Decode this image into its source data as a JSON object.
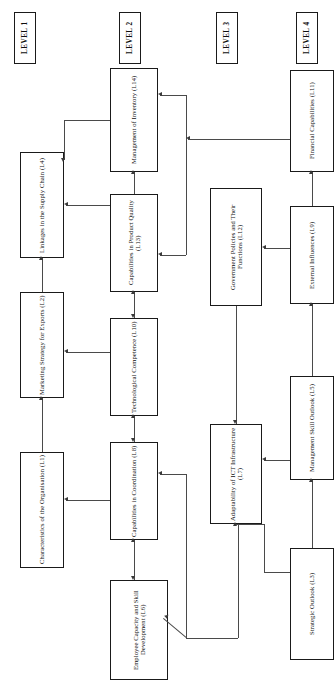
{
  "diagram": {
    "orientation": "rotated-90-ccw",
    "levels": [
      {
        "id": "lvl1",
        "label": "LEVEL 1"
      },
      {
        "id": "lvl2",
        "label": "LEVEL 2"
      },
      {
        "id": "lvl3",
        "label": "LEVEL 3"
      },
      {
        "id": "lvl4",
        "label": "LEVEL 4"
      }
    ],
    "nodes": [
      {
        "id": "L4",
        "label": "Linkages in the Supply Chain (L4)",
        "level": "LEVEL 1"
      },
      {
        "id": "L2",
        "label": "Marketing Strategy for Exports (L2)",
        "level": "LEVEL 1"
      },
      {
        "id": "L1",
        "label": "Characteristics of the Organisation (L1)",
        "level": "LEVEL 1"
      },
      {
        "id": "L14",
        "label": "Management of Inventory (L14)",
        "level": "LEVEL 2"
      },
      {
        "id": "L13",
        "label": "Capabilities in Product Quality (L13)",
        "level": "LEVEL 2"
      },
      {
        "id": "L10",
        "label": "Technological Competence (L10)",
        "level": "LEVEL 2"
      },
      {
        "id": "L8",
        "label": "Capabilities in Coordination (L8)",
        "level": "LEVEL 2"
      },
      {
        "id": "L6",
        "label": "Employee Capacity and Skill Development (L6)",
        "level": "LEVEL 2"
      },
      {
        "id": "L12",
        "label": "Government Policies and Their Functions (L12)",
        "level": "LEVEL 3"
      },
      {
        "id": "L7",
        "label": "Adaptability of ICT Infrastructure (L7)",
        "level": "LEVEL 3"
      },
      {
        "id": "L11",
        "label": "Financial Capabilities (L11)",
        "level": "LEVEL 4"
      },
      {
        "id": "L9",
        "label": "External Influences (L9)",
        "level": "LEVEL 4"
      },
      {
        "id": "L5",
        "label": "Management Skill Outlook (L5)",
        "level": "LEVEL 4"
      },
      {
        "id": "L3",
        "label": "Strategic Outlook (L3)",
        "level": "LEVEL 4"
      }
    ],
    "colors": {
      "box_border": "#1a1a1a",
      "box_fill": "#ffffff",
      "edge": "#4a4a4a",
      "text": "#0d0d0d",
      "background": "#ffffff"
    }
  }
}
